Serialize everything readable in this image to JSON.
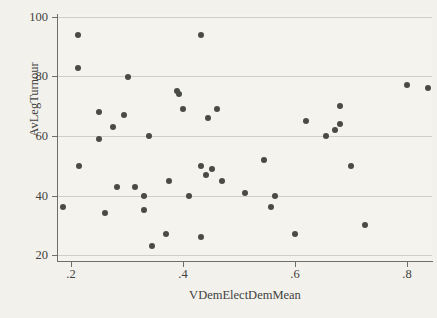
{
  "chart_data": {
    "type": "scatter",
    "title": "",
    "xlabel": "VDemElectDemMean",
    "ylabel": "AvLegTurnour",
    "xlim": [
      0.175,
      0.845
    ],
    "ylim": [
      18,
      101
    ],
    "xticks": [
      ".2",
      ".4",
      ".6",
      ".8"
    ],
    "xtick_values": [
      0.2,
      0.4,
      0.6,
      0.8
    ],
    "yticks": [
      "20",
      "40",
      "60",
      "80",
      "100"
    ],
    "ytick_values": [
      20,
      40,
      60,
      80,
      100
    ],
    "grid": "horizontal",
    "legend": "none",
    "marker_color": "#4a4a46",
    "background_color": "#f2f1ec",
    "gridline_color": "#cfcec7",
    "axis_color": "#6f6e69",
    "points": [
      {
        "x": 0.185,
        "y": 36
      },
      {
        "x": 0.213,
        "y": 94
      },
      {
        "x": 0.213,
        "y": 83
      },
      {
        "x": 0.215,
        "y": 50
      },
      {
        "x": 0.25,
        "y": 68
      },
      {
        "x": 0.25,
        "y": 59
      },
      {
        "x": 0.26,
        "y": 34
      },
      {
        "x": 0.275,
        "y": 63
      },
      {
        "x": 0.282,
        "y": 43
      },
      {
        "x": 0.295,
        "y": 67
      },
      {
        "x": 0.302,
        "y": 80
      },
      {
        "x": 0.314,
        "y": 43
      },
      {
        "x": 0.33,
        "y": 40
      },
      {
        "x": 0.33,
        "y": 35
      },
      {
        "x": 0.34,
        "y": 60
      },
      {
        "x": 0.345,
        "y": 23
      },
      {
        "x": 0.37,
        "y": 27
      },
      {
        "x": 0.375,
        "y": 45
      },
      {
        "x": 0.39,
        "y": 75
      },
      {
        "x": 0.392,
        "y": 74
      },
      {
        "x": 0.4,
        "y": 69
      },
      {
        "x": 0.41,
        "y": 40
      },
      {
        "x": 0.432,
        "y": 94
      },
      {
        "x": 0.432,
        "y": 50
      },
      {
        "x": 0.433,
        "y": 26
      },
      {
        "x": 0.442,
        "y": 47
      },
      {
        "x": 0.445,
        "y": 66
      },
      {
        "x": 0.452,
        "y": 49
      },
      {
        "x": 0.46,
        "y": 69
      },
      {
        "x": 0.47,
        "y": 45
      },
      {
        "x": 0.51,
        "y": 41
      },
      {
        "x": 0.545,
        "y": 52
      },
      {
        "x": 0.557,
        "y": 36
      },
      {
        "x": 0.565,
        "y": 40
      },
      {
        "x": 0.6,
        "y": 27
      },
      {
        "x": 0.62,
        "y": 65
      },
      {
        "x": 0.655,
        "y": 60
      },
      {
        "x": 0.672,
        "y": 62
      },
      {
        "x": 0.68,
        "y": 70
      },
      {
        "x": 0.68,
        "y": 64
      },
      {
        "x": 0.7,
        "y": 50
      },
      {
        "x": 0.725,
        "y": 30
      },
      {
        "x": 0.8,
        "y": 77
      },
      {
        "x": 0.838,
        "y": 76
      }
    ]
  }
}
